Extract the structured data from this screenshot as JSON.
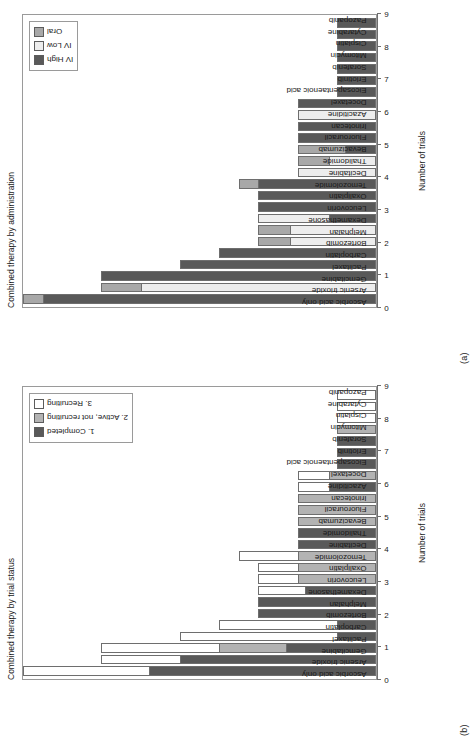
{
  "figure": {
    "xlabel": "Number of trials",
    "panel_a_letter": "(a)",
    "panel_b_letter": "(b)"
  },
  "colors": {
    "dark": "#595959",
    "mid": "#b3b3b3",
    "light": "#ffffff",
    "oral": "#a6a6a6",
    "ivlow": "#e6e6e6",
    "axis": "#6e6e6e",
    "border": "#9a9a9a"
  },
  "panel_a": {
    "letter": "(a)",
    "title": "Combined therapy by administration",
    "legend": {
      "items": [
        {
          "label": "IV High",
          "color": "#595959"
        },
        {
          "label": "IV Low",
          "color": "#ededed"
        },
        {
          "label": "Oral",
          "color": "#a8a8a8"
        }
      ]
    },
    "chart_data": {
      "type": "bar",
      "title": "Combined therapy by administration",
      "xlabel": "Number of trials",
      "ylabel": "",
      "orientation": "horizontal-rotated",
      "stacked": true,
      "grid": false,
      "legend_position": "top-right",
      "xlim": [
        0,
        9
      ],
      "xticks": [
        0,
        1,
        2,
        3,
        4,
        5,
        6,
        7,
        8,
        9
      ],
      "categories": [
        "Ascorbic acid only",
        "Arsenic trioxide",
        "Gemcitabine",
        "Paclitaxel",
        "Carboplatin",
        "Bortezomib",
        "Melphalan",
        "Dexamethasone",
        "Leucovorin",
        "Oxaliplatin",
        "Temozolomide",
        "Decitabine",
        "Thalidomide",
        "Bevacizumab",
        "Fluorouracil",
        "Irinotecan",
        "Azacitidine",
        "Docetaxel",
        "Eicosapentaenoic acid",
        "Erlotinib",
        "Sorafenib",
        "Mitomycin",
        "Cisplatin",
        "Cytarabine",
        "Pazopanib"
      ],
      "series": [
        {
          "name": "IV High",
          "color": "#595959",
          "values": [
            8.5,
            0,
            7,
            5,
            4,
            0,
            0,
            1.2,
            3,
            3,
            3,
            0,
            0,
            0.8,
            2,
            2,
            0,
            2,
            1,
            1,
            1,
            1,
            1,
            1,
            1
          ]
        },
        {
          "name": "IV Low",
          "color": "#ededed",
          "values": [
            0,
            6,
            0,
            0,
            0,
            2.2,
            2.2,
            1.8,
            0,
            0,
            0,
            2,
            1.2,
            0,
            0,
            0,
            2,
            0,
            0,
            0,
            0,
            0,
            0,
            0,
            0
          ]
        },
        {
          "name": "Oral",
          "color": "#a8a8a8",
          "values": [
            0.5,
            1,
            0,
            0,
            0,
            0.8,
            0.8,
            0,
            0,
            0,
            0.5,
            0,
            0.8,
            1.2,
            0,
            0,
            0,
            0,
            0,
            0,
            0,
            0,
            0,
            0,
            0
          ]
        }
      ],
      "totals": [
        9,
        7,
        7,
        5,
        4,
        3,
        3,
        3,
        3,
        3,
        3.5,
        2,
        2,
        2,
        2,
        2,
        2,
        2,
        1,
        1,
        1,
        1,
        1,
        1,
        1
      ]
    }
  },
  "panel_b": {
    "letter": "(b)",
    "title": "Combined therapy by trial status",
    "legend": {
      "items": [
        {
          "label": "1. Completed",
          "color": "#595959"
        },
        {
          "label": "2. Active, not recruiting",
          "color": "#b3b3b3"
        },
        {
          "label": "3. Recruiting",
          "color": "#ffffff"
        }
      ]
    },
    "chart_data": {
      "type": "bar",
      "title": "Combined therapy by trial status",
      "xlabel": "Number of trials",
      "ylabel": "",
      "orientation": "horizontal-rotated",
      "stacked": true,
      "grid": false,
      "legend_position": "top-right",
      "xlim": [
        0,
        9
      ],
      "xticks": [
        0,
        1,
        2,
        3,
        4,
        5,
        6,
        7,
        8,
        9
      ],
      "categories": [
        "Ascorbic acid only",
        "Arsenic trioxide",
        "Gemcitabine",
        "Paclitaxel",
        "Carboplatin",
        "Bortezomib",
        "Melphalan",
        "Dexamethasone",
        "Leucovorin",
        "Oxaliplatin",
        "Temozolomide",
        "Decitabine",
        "Thalidomide",
        "Bevacizumab",
        "Fluorouracil",
        "Irinotecan",
        "Azacitidine",
        "Docetaxel",
        "Eicosapentaenoic acid",
        "Erlotinib",
        "Sorafenib",
        "Mitomycin",
        "Cisplatin",
        "Cytarabine",
        "Pazopanib"
      ],
      "series": [
        {
          "name": "1. Completed",
          "color": "#595959",
          "values": [
            5.8,
            5,
            2.3,
            1,
            1,
            3,
            3,
            1.8,
            0,
            0,
            0,
            2,
            2,
            0,
            0,
            0,
            1.2,
            0,
            1,
            1,
            1,
            0,
            0,
            0,
            0
          ]
        },
        {
          "name": "2. Active, not recruiting",
          "color": "#b3b3b3",
          "values": [
            0,
            0,
            1.7,
            0,
            0,
            0,
            0,
            0,
            2,
            2,
            2,
            0,
            0,
            2,
            2,
            2,
            0,
            1.2,
            0,
            0,
            0,
            1,
            0,
            0,
            0
          ]
        },
        {
          "name": "3. Recruiting",
          "color": "#ffffff",
          "values": [
            3.2,
            2,
            3,
            4,
            3,
            0,
            0,
            1.2,
            1,
            1,
            1.5,
            0,
            0,
            0,
            0,
            0,
            0.8,
            0.8,
            0,
            0,
            0,
            0,
            1,
            1,
            1
          ]
        }
      ],
      "totals": [
        9,
        7,
        7,
        5,
        4,
        3,
        3,
        3,
        3,
        3,
        3.5,
        2,
        2,
        2,
        2,
        2,
        2,
        2,
        1,
        1,
        1,
        1,
        1,
        1,
        1
      ]
    }
  }
}
